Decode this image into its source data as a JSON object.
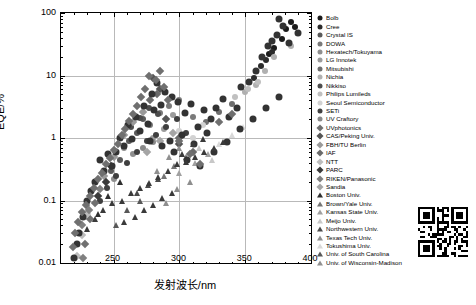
{
  "chart_data": {
    "type": "scatter",
    "title": "",
    "xlabel": "发射波长/nm",
    "ylabel": "EQE/%",
    "xlim": [
      210,
      400
    ],
    "ylim": [
      0.01,
      100
    ],
    "yscale": "log",
    "grid": true,
    "legend_position": "right",
    "xticks": [
      250,
      300,
      350,
      400
    ],
    "yticks": [
      "0.01",
      "0.1",
      "1",
      "10",
      "100"
    ],
    "series": [
      {
        "name": "Bolb",
        "marker": "circle",
        "color": "#1a1a1a",
        "points": [
          [
            378,
            38
          ],
          [
            381,
            55
          ],
          [
            385,
            72
          ],
          [
            372,
            28
          ],
          [
            388,
            60
          ],
          [
            368,
            22
          ]
        ]
      },
      {
        "name": "Cree",
        "marker": "circle",
        "color": "#2b2b2b",
        "points": [
          [
            362,
            14
          ],
          [
            366,
            18
          ],
          [
            357,
            9
          ],
          [
            370,
            24
          ]
        ]
      },
      {
        "name": "Crystal IS",
        "marker": "circle",
        "color": "#5a5a5a",
        "points": [
          [
            262,
            0.9
          ],
          [
            268,
            1.2
          ],
          [
            255,
            0.45
          ],
          [
            272,
            2.0
          ],
          [
            248,
            0.3
          ]
        ]
      },
      {
        "name": "DOWA",
        "marker": "circle",
        "color": "#7a7a7a",
        "points": [
          [
            285,
            2.5
          ],
          [
            292,
            3.2
          ],
          [
            278,
            1.6
          ],
          [
            300,
            4.0
          ],
          [
            310,
            2.2
          ]
        ]
      },
      {
        "name": "Hexatech/Tokuyama",
        "marker": "circle",
        "color": "#8f8f8f",
        "points": [
          [
            258,
            0.7
          ],
          [
            265,
            0.55
          ],
          [
            250,
            0.22
          ]
        ]
      },
      {
        "name": "LG Innotek",
        "marker": "circle",
        "color": "#9c9c9c",
        "points": [
          [
            280,
            1.0
          ],
          [
            288,
            1.4
          ],
          [
            295,
            2.3
          ]
        ]
      },
      {
        "name": "Mitsubishi",
        "marker": "circle",
        "color": "#6e6e6e",
        "points": [
          [
            320,
            1.8
          ],
          [
            330,
            2.6
          ],
          [
            340,
            3.5
          ]
        ]
      },
      {
        "name": "Nichia",
        "marker": "circle",
        "color": "#b0b0b0",
        "points": [
          [
            365,
            12
          ],
          [
            372,
            20
          ],
          [
            358,
            7
          ],
          [
            350,
            5.5
          ],
          [
            385,
            30
          ]
        ]
      },
      {
        "name": "Nikkiso",
        "marker": "circle",
        "color": "#4d4d4d",
        "points": [
          [
            263,
            1.5
          ],
          [
            270,
            2.1
          ],
          [
            277,
            3.0
          ],
          [
            284,
            2.4
          ]
        ]
      },
      {
        "name": "Philips Lumileds",
        "marker": "circle",
        "color": "#c0c0c0",
        "points": [
          [
            342,
            4.5
          ],
          [
            352,
            6.0
          ],
          [
            360,
            8.0
          ]
        ]
      },
      {
        "name": "Seoul Semiconductor",
        "marker": "circle",
        "color": "#d2d2d2",
        "points": [
          [
            300,
            1.3
          ],
          [
            310,
            1.0
          ],
          [
            318,
            1.6
          ]
        ]
      },
      {
        "name": "SETi",
        "marker": "circle",
        "color": "#3f3f3f",
        "points": [
          [
            240,
            0.1
          ],
          [
            245,
            0.16
          ],
          [
            252,
            0.25
          ],
          [
            260,
            0.4
          ],
          [
            268,
            0.6
          ],
          [
            275,
            0.9
          ],
          [
            282,
            1.1
          ],
          [
            290,
            1.5
          ],
          [
            298,
            2.0
          ],
          [
            305,
            1.2
          ]
        ]
      },
      {
        "name": "UV Craftory",
        "marker": "circle",
        "color": "#8a8a8a",
        "points": [
          [
            272,
            0.7
          ],
          [
            280,
            0.85
          ]
        ]
      },
      {
        "name": "UVphotonics",
        "marker": "diamond",
        "color": "#707070",
        "points": [
          [
            228,
            0.02
          ],
          [
            232,
            0.05
          ],
          [
            236,
            0.09
          ]
        ]
      },
      {
        "name": "CAS/Peking Univ.",
        "marker": "diamond",
        "color": "#555555",
        "points": [
          [
            280,
            9.0
          ],
          [
            285,
            6.0
          ],
          [
            290,
            2.0
          ],
          [
            300,
            0.8
          ]
        ]
      },
      {
        "name": "FBH/TU Berlin",
        "marker": "diamond",
        "color": "#9a9a9a",
        "points": [
          [
            265,
            1.8
          ],
          [
            272,
            2.6
          ],
          [
            258,
            1.1
          ],
          [
            250,
            0.5
          ],
          [
            243,
            0.25
          ]
        ]
      },
      {
        "name": "IAF",
        "marker": "diamond",
        "color": "#6a6a6a",
        "points": [
          [
            278,
            4.0
          ],
          [
            283,
            5.0
          ],
          [
            300,
            1.0
          ],
          [
            310,
            0.6
          ]
        ]
      },
      {
        "name": "NTT",
        "marker": "diamond",
        "color": "#bdbdbd",
        "points": [
          [
            222,
            0.013
          ],
          [
            226,
            0.028
          ],
          [
            230,
            0.06
          ]
        ]
      },
      {
        "name": "PARC",
        "marker": "diamond",
        "color": "#3a3a3a",
        "points": [
          [
            238,
            0.12
          ],
          [
            244,
            0.2
          ],
          [
            248,
            0.35
          ]
        ]
      },
      {
        "name": "RIKEN/Panasonic",
        "marker": "diamond",
        "color": "#808080",
        "points": [
          [
            226,
            0.04
          ],
          [
            231,
            0.07
          ],
          [
            240,
            0.15
          ],
          [
            227,
            0.012
          ]
        ]
      },
      {
        "name": "Sandia",
        "marker": "diamond",
        "color": "#a5a5a5",
        "points": [
          [
            275,
            0.6
          ],
          [
            285,
            0.9
          ],
          [
            295,
            1.2
          ]
        ]
      },
      {
        "name": "Boston Univ.",
        "marker": "tri",
        "color": "#2f2f2f",
        "points": [
          [
            238,
            0.06
          ],
          [
            246,
            0.12
          ],
          [
            255,
            0.2
          ]
        ]
      },
      {
        "name": "Brown/Yale Univ.",
        "marker": "tri",
        "color": "#767676",
        "points": [
          [
            288,
            0.25
          ],
          [
            296,
            0.35
          ],
          [
            305,
            0.5
          ]
        ]
      },
      {
        "name": "Kansas State Univ.",
        "marker": "tri",
        "color": "#a0a0a0",
        "points": [
          [
            300,
            0.28
          ],
          [
            312,
            0.4
          ],
          [
            322,
            0.55
          ]
        ]
      },
      {
        "name": "Meijo Univ.",
        "marker": "tri",
        "color": "#c8c8c8",
        "points": [
          [
            315,
            0.7
          ],
          [
            325,
            0.45
          ],
          [
            335,
            0.9
          ]
        ]
      },
      {
        "name": "Northwestern Univ.",
        "marker": "tri",
        "color": "#4a4a4a",
        "points": [
          [
            268,
            0.13
          ],
          [
            276,
            0.18
          ],
          [
            284,
            0.22
          ]
        ]
      },
      {
        "name": "Texas Tech Univ.",
        "marker": "tri",
        "color": "#8e8e8e",
        "points": [
          [
            290,
            0.09
          ],
          [
            298,
            0.15
          ],
          [
            308,
            0.2
          ]
        ]
      },
      {
        "name": "Tokushima Univ.",
        "marker": "tri",
        "color": "#d8d8d8",
        "points": [
          [
            330,
            0.8
          ],
          [
            340,
            1.1
          ],
          [
            348,
            1.5
          ]
        ]
      },
      {
        "name": "Univ. of South Carolina",
        "marker": "tri",
        "color": "#585858",
        "points": [
          [
            252,
            0.04
          ],
          [
            260,
            0.07
          ],
          [
            270,
            0.1
          ]
        ]
      },
      {
        "name": "Univ. of Wisconsin-Madison",
        "marker": "tri",
        "color": "#909090",
        "points": [
          [
            283,
            0.3
          ],
          [
            292,
            0.5
          ],
          [
            300,
            0.7
          ]
        ]
      }
    ],
    "extra_points": [
      {
        "marker": "circle",
        "color": "#333333",
        "size": 7,
        "points": [
          [
            374,
            45
          ],
          [
            379,
            62
          ],
          [
            383,
            33
          ],
          [
            390,
            48
          ],
          [
            376,
            80
          ],
          [
            370,
            35
          ],
          [
            363,
            20
          ],
          [
            367,
            30
          ],
          [
            358,
            12
          ],
          [
            353,
            8
          ],
          [
            347,
            6.5
          ],
          [
            344,
            3.0
          ],
          [
            338,
            2.2
          ],
          [
            333,
            4.2
          ],
          [
            328,
            3.0
          ],
          [
            324,
            2.0
          ],
          [
            319,
            2.8
          ],
          [
            314,
            1.5
          ],
          [
            309,
            3.5
          ],
          [
            304,
            2.5
          ],
          [
            299,
            3.8
          ],
          [
            294,
            4.5
          ],
          [
            289,
            5.5
          ],
          [
            286,
            3.4
          ],
          [
            283,
            7.5
          ],
          [
            281,
            2.8
          ],
          [
            279,
            5.0
          ],
          [
            276,
            1.7
          ],
          [
            273,
            3.3
          ],
          [
            270,
            1.3
          ],
          [
            267,
            2.2
          ],
          [
            264,
            0.95
          ],
          [
            261,
            1.6
          ],
          [
            258,
            0.75
          ],
          [
            255,
            1.0
          ],
          [
            252,
            0.6
          ],
          [
            249,
            0.35
          ],
          [
            246,
            0.55
          ],
          [
            243,
            0.3
          ],
          [
            240,
            0.45
          ],
          [
            236,
            0.2
          ],
          [
            233,
            0.14
          ],
          [
            230,
            0.1
          ],
          [
            227,
            0.055
          ],
          [
            224,
            0.03
          ],
          [
            222,
            0.02
          ],
          [
            220,
            0.012
          ],
          [
            293,
            0.9
          ],
          [
            302,
            1.1
          ],
          [
            311,
            0.8
          ],
          [
            321,
            1.2
          ],
          [
            296,
            0.6
          ],
          [
            287,
            0.75
          ],
          [
            278,
            0.9
          ],
          [
            306,
            0.45
          ],
          [
            316,
            0.35
          ],
          [
            326,
            0.6
          ],
          [
            336,
            0.85
          ],
          [
            346,
            1.4
          ],
          [
            356,
            2.0
          ],
          [
            366,
            3.0
          ],
          [
            376,
            4.5
          ]
        ]
      },
      {
        "marker": "diamond",
        "color": "#6f6f6f",
        "size": 6,
        "points": [
          [
            285,
            12
          ],
          [
            282,
            8.5
          ],
          [
            288,
            6.5
          ],
          [
            291,
            4.0
          ],
          [
            277,
            10.0
          ],
          [
            274,
            6.0
          ],
          [
            271,
            4.5
          ],
          [
            268,
            3.2
          ],
          [
            265,
            2.4
          ],
          [
            262,
            1.9
          ],
          [
            259,
            1.4
          ],
          [
            256,
            1.1
          ],
          [
            253,
            0.8
          ],
          [
            250,
            0.65
          ],
          [
            247,
            0.48
          ],
          [
            244,
            0.38
          ],
          [
            241,
            0.28
          ],
          [
            238,
            0.22
          ],
          [
            235,
            0.16
          ],
          [
            232,
            0.12
          ],
          [
            229,
            0.085
          ],
          [
            226,
            0.065
          ],
          [
            223,
            0.045
          ],
          [
            221,
            0.03
          ],
          [
            219,
            0.018
          ],
          [
            300,
            0.9
          ],
          [
            308,
            0.55
          ],
          [
            316,
            0.38
          ],
          [
            330,
            1.8
          ],
          [
            340,
            2.4
          ]
        ]
      },
      {
        "marker": "tri",
        "color": "#3a3a3a",
        "size": 6,
        "points": [
          [
            249,
            0.09
          ],
          [
            256,
            0.1
          ],
          [
            263,
            0.13
          ],
          [
            270,
            0.16
          ],
          [
            277,
            0.19
          ],
          [
            284,
            0.24
          ],
          [
            291,
            0.3
          ],
          [
            298,
            0.38
          ],
          [
            305,
            0.42
          ],
          [
            312,
            0.5
          ],
          [
            319,
            0.6
          ],
          [
            326,
            0.7
          ],
          [
            333,
            0.85
          ],
          [
            242,
            0.07
          ],
          [
            236,
            0.05
          ],
          [
            230,
            0.035
          ],
          [
            294,
            0.13
          ],
          [
            287,
            0.11
          ],
          [
            280,
            0.085
          ],
          [
            273,
            0.07
          ],
          [
            266,
            0.055
          ],
          [
            258,
            0.045
          ],
          [
            302,
            0.55
          ],
          [
            310,
            0.8
          ],
          [
            318,
            0.95
          ]
        ]
      }
    ]
  },
  "qr_code": {
    "label": "qr-code",
    "modules": 21
  }
}
